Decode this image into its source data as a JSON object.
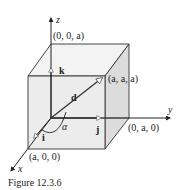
{
  "figure": {
    "caption": "Figure 12.3.6",
    "axes": {
      "x_label": "x",
      "y_label": "y",
      "z_label": "z"
    },
    "points": {
      "z_corner": "(0, 0, a)",
      "diagonal_corner": "(a, a, a)",
      "y_corner": "(0, a, 0)",
      "x_corner": "(a, 0, 0)"
    },
    "vectors": {
      "i": "i",
      "j": "j",
      "k": "k",
      "d": "d"
    },
    "angle_label": "α",
    "colors": {
      "cube_front": "#ececec",
      "cube_top": "#f3f3f3",
      "cube_right": "#dcdcdc",
      "edges": "#333333",
      "axes": "#222222"
    }
  }
}
